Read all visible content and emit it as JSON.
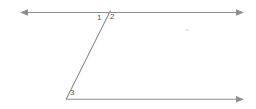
{
  "diagram": {
    "background_color": "#ffffff",
    "line_color": "#8d8d93",
    "label_color": "#555558",
    "labels": [
      {
        "id": "1",
        "text": "1",
        "x": 100,
        "y": 18
      },
      {
        "id": "2",
        "text": "2",
        "x": 113,
        "y": 17
      },
      {
        "id": "3",
        "text": "3",
        "x": 73,
        "y": 93
      }
    ],
    "lines": [
      {
        "name": "top-parallel-line",
        "x1": 21,
        "y1": 12,
        "x2": 243,
        "y2": 12,
        "arrow_start": true,
        "arrow_end": true
      },
      {
        "name": "bottom-parallel-line",
        "x1": 66,
        "y1": 99,
        "x2": 243,
        "y2": 99,
        "arrow_start": false,
        "arrow_end": true
      },
      {
        "name": "transversal-line",
        "x1": 110,
        "y1": 11,
        "x2": 66,
        "y2": 99,
        "arrow_start": false,
        "arrow_end": false
      }
    ],
    "vertices": [
      {
        "name": "top-intersection",
        "x": 110,
        "y": 12
      },
      {
        "name": "bottom-vertex",
        "x": 66,
        "y": 99
      }
    ],
    "stray_mark": {
      "x": 185,
      "y": 29,
      "width": 4,
      "height": 2
    }
  }
}
